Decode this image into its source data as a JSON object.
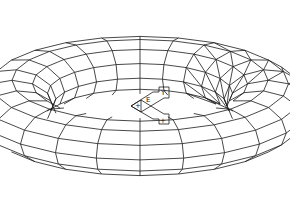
{
  "viewport": {
    "background": "#ffffff",
    "line_color": "#1a1a1a"
  },
  "model": {
    "type": "torus-wireframe",
    "center": [
      140,
      106
    ],
    "major_radius": 100,
    "minor_radius": 32,
    "tilt_deg": 63,
    "segments_major": 24,
    "segments_minor": 12,
    "triangulated_sectors": [
      20,
      21,
      22,
      23
    ]
  },
  "ucs_icon": {
    "position": [
      133,
      88
    ],
    "labels": [
      "+",
      "E",
      "+",
      "Y"
    ]
  }
}
